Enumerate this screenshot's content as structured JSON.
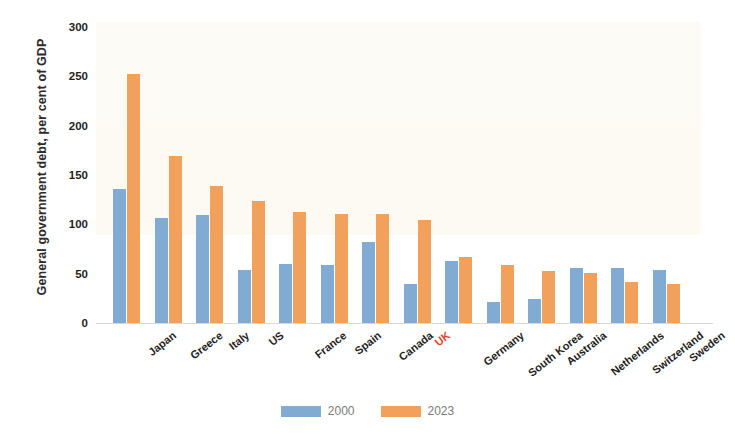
{
  "chart_data": {
    "type": "bar",
    "title": "",
    "xlabel": "",
    "ylabel": "General government debt, per cent of GDP",
    "ylim": [
      0,
      300
    ],
    "yticks": [
      0,
      50,
      100,
      150,
      200,
      250,
      300
    ],
    "grid": false,
    "legend_position": "bottom-center",
    "highlight_category": "UK",
    "highlight_color": "#e8402a",
    "categories": [
      "Japan",
      "Greece",
      "Italy",
      "US",
      "France",
      "Spain",
      "Canada",
      "UK",
      "Germany",
      "South Korea",
      "Australia",
      "Netherlands",
      "Switzerland",
      "Sweden"
    ],
    "series": [
      {
        "name": "2000",
        "color": "#82abd4",
        "values": [
          136,
          106,
          109,
          54,
          60,
          59,
          82,
          40,
          63,
          21,
          24,
          56,
          56,
          54
        ]
      },
      {
        "name": "2023",
        "color": "#f2a15c",
        "values": [
          252,
          169,
          139,
          124,
          113,
          110,
          110,
          104,
          67,
          59,
          53,
          51,
          42,
          40
        ]
      }
    ]
  },
  "axis": {
    "y_title": "General government debt, per cent of GDP",
    "y_tick_labels": [
      "300",
      "250",
      "200",
      "150",
      "100",
      "50",
      "0"
    ]
  },
  "legend": {
    "items": [
      {
        "label": "2000",
        "swatch": "blue-swatch"
      },
      {
        "label": "2023",
        "swatch": "orange-swatch"
      }
    ]
  }
}
